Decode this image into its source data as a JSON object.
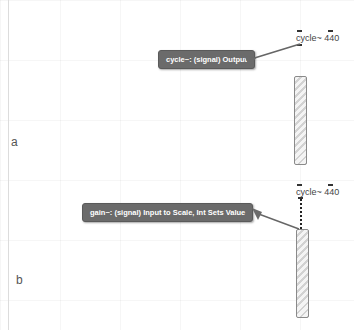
{
  "labels": {
    "a": "a",
    "b": "b"
  },
  "section_a": {
    "object": {
      "name": "cycle~",
      "arg": "440",
      "text": "cycle~ 440"
    },
    "tooltip": "cycle~: (signal) Output"
  },
  "section_b": {
    "object": {
      "name": "cycle~",
      "arg": "440",
      "text": "cycle~ 440"
    },
    "tooltip": "gain~: (signal) Input to Scale, Int Sets Value"
  },
  "colors": {
    "tooltip_bg": "#6b6b6b",
    "tooltip_text": "#ffffff",
    "background": "#ffffff"
  }
}
